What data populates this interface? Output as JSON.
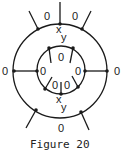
{
  "figure": {
    "caption": "Figure 20",
    "stroke_color": "#1a1a1a",
    "background": "#ffffff"
  },
  "labels": {
    "outer_top_left": "0",
    "outer_top_right": "0",
    "outer_left": "0",
    "outer_right": "0",
    "outer_bottom": "0",
    "inner_top": "0",
    "inner_left": "0",
    "inner_right": "0",
    "inner_bottom_left": "0",
    "inner_bottom_right": "0",
    "top_x": "x",
    "top_y": "y",
    "bottom_x": "x",
    "bottom_y": "y"
  }
}
